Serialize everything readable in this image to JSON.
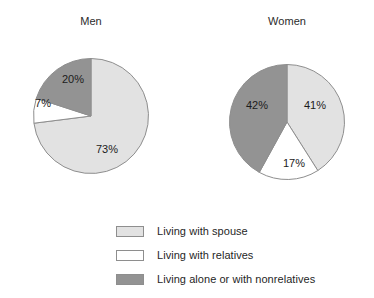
{
  "chart_data": {
    "type": "pie",
    "title": "",
    "legend_position": "bottom",
    "grid": false,
    "categories": [
      "Living with spouse",
      "Living with relatives",
      "Living alone or with nonrelatives"
    ],
    "colors": {
      "living_with_spouse": "#e2e2e2",
      "living_with_relatives": "#ffffff",
      "living_alone_or_with_nonrelatives": "#939393",
      "outline": "#8e8e8e",
      "text": "#1b1b1b",
      "background": "#ffffff"
    },
    "charts": [
      {
        "title": "Men",
        "values": [
          73,
          7,
          20
        ],
        "labels": [
          "73%",
          "7%",
          "20%"
        ]
      },
      {
        "title": "Women",
        "values": [
          41,
          17,
          42
        ],
        "labels": [
          "41%",
          "17%",
          "42%"
        ]
      }
    ]
  },
  "pies": {
    "men": {
      "title": "Men",
      "slices": [
        {
          "label": "73%",
          "value": 73,
          "category": "Living with spouse"
        },
        {
          "label": "7%",
          "value": 7,
          "category": "Living with relatives"
        },
        {
          "label": "20%",
          "value": 20,
          "category": "Living alone or with nonrelatives"
        }
      ]
    },
    "women": {
      "title": "Women",
      "slices": [
        {
          "label": "41%",
          "value": 41,
          "category": "Living with spouse"
        },
        {
          "label": "17%",
          "value": 17,
          "category": "Living with relatives"
        },
        {
          "label": "42%",
          "value": 42,
          "category": "Living alone or with nonrelatives"
        }
      ]
    }
  },
  "legend": {
    "items": [
      {
        "label": "Living with spouse",
        "swatch": "#e2e2e2"
      },
      {
        "label": "Living with relatives",
        "swatch": "#ffffff"
      },
      {
        "label": "Living alone or with nonrelatives",
        "swatch": "#939393"
      }
    ]
  }
}
